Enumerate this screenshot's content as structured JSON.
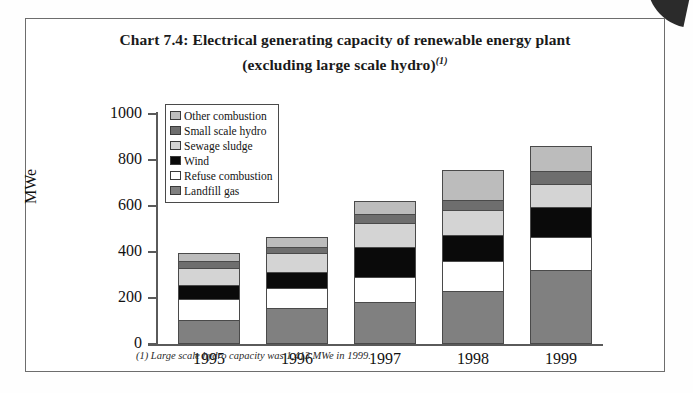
{
  "page": {
    "corner_mark": "scan-corner-artifact"
  },
  "chart_data": {
    "type": "bar",
    "subtype": "stacked",
    "title": "Chart 7.4:  Electrical generating capacity of renewable energy plant",
    "title_line2": "(excluding large scale hydro)",
    "title_superscript": "(1)",
    "xlabel": "",
    "ylabel": "MWe",
    "ylim": [
      0,
      1000
    ],
    "yticks": [
      0,
      200,
      400,
      600,
      800,
      1000
    ],
    "ytick_labels": [
      "0",
      "200",
      "400",
      "600",
      "800",
      "1000"
    ],
    "grid": false,
    "legend_position": "upper-left-inside",
    "categories": [
      "1995",
      "1996",
      "1997",
      "1998",
      "1999"
    ],
    "series": [
      {
        "name": "Landfill gas",
        "color": "#808080",
        "values": [
          100,
          150,
          175,
          225,
          315
        ]
      },
      {
        "name": "Refuse combustion",
        "color": "#ffffff",
        "values": [
          90,
          90,
          110,
          130,
          145
        ]
      },
      {
        "name": "Wind",
        "color": "#0a0a0a",
        "values": [
          65,
          70,
          135,
          115,
          135
        ]
      },
      {
        "name": "Sewage sludge",
        "color": "#d4d4d4",
        "values": [
          75,
          85,
          105,
          110,
          100
        ]
      },
      {
        "name": "Small scale hydro",
        "color": "#6e6e6e",
        "values": [
          30,
          25,
          40,
          45,
          55
        ]
      },
      {
        "name": "Other combustion",
        "color": "#bcbcbc",
        "values": [
          35,
          45,
          55,
          130,
          110
        ]
      }
    ],
    "legend_order": [
      "Other combustion",
      "Small scale hydro",
      "Sewage sludge",
      "Wind",
      "Refuse combustion",
      "Landfill gas"
    ],
    "totals": [
      450,
      565,
      620,
      755,
      860
    ],
    "annotations": [
      "(1) Large scale hydro capacity was 1,413 MWe in 1999."
    ]
  },
  "footnote": {
    "marker": "(1)",
    "text": "(1) Large scale hydro capacity was 1,413 MWe in 1999."
  }
}
